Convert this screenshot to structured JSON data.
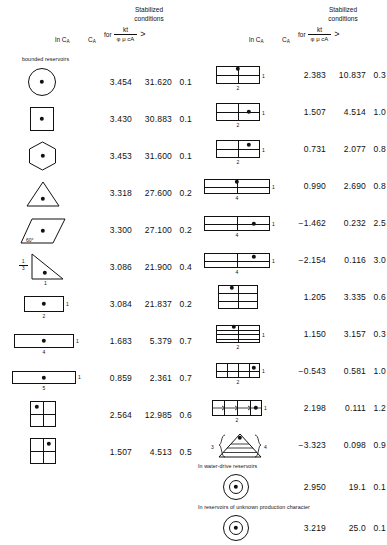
{
  "header": {
    "stabilized_line1": "Stabilized",
    "stabilized_line2": "conditions",
    "for_label": "for",
    "fraction_numerator": "kt",
    "fraction_denominator": "φ μ cA",
    "greater_than": ">",
    "ln_ca_label": "ln C",
    "ln_ca_sub": "A",
    "ca_label": "C",
    "ca_sub": "A"
  },
  "sections": {
    "bounded": "bounded reservoirs",
    "water_drive": "In water-drive reservoirs",
    "unknown": "In reservoirs of unknown production character"
  },
  "left_rows": [
    {
      "shape": "circle-centered",
      "ln_ca": "3.454",
      "ca": "31.620",
      "t_daa": "0.1",
      "labels": {}
    },
    {
      "shape": "square-centered",
      "ln_ca": "3.430",
      "ca": "30.883",
      "t_daa": "0.1",
      "labels": {}
    },
    {
      "shape": "hexagon-centered",
      "ln_ca": "3.453",
      "ca": "31.600",
      "t_daa": "0.1",
      "labels": {}
    },
    {
      "shape": "triangle-centered",
      "ln_ca": "3.318",
      "ca": "27.600",
      "t_daa": "0.2",
      "labels": {}
    },
    {
      "shape": "parallelogram-60",
      "ln_ca": "3.300",
      "ca": "27.100",
      "t_daa": "0.2",
      "labels": {
        "angle": "60°"
      }
    },
    {
      "shape": "right-triangle",
      "ln_ca": "3.086",
      "ca": "21.900",
      "t_daa": "0.4",
      "labels": {
        "left_num": "1",
        "left_den": "3",
        "bottom": "1"
      }
    },
    {
      "shape": "rect-2x1-center",
      "ln_ca": "3.084",
      "ca": "21.837",
      "t_daa": "0.2",
      "labels": {
        "bottom": "2",
        "right": "1"
      }
    },
    {
      "shape": "rect-4x1-center",
      "ln_ca": "1.683",
      "ca": "5.379",
      "t_daa": "0.7",
      "labels": {
        "bottom": "4",
        "right": "1"
      }
    },
    {
      "shape": "rect-5x1-center",
      "ln_ca": "0.859",
      "ca": "2.361",
      "t_daa": "0.7",
      "labels": {
        "bottom": "5",
        "right": "1"
      }
    },
    {
      "shape": "quad-square-top-left",
      "ln_ca": "2.564",
      "ca": "12.985",
      "t_daa": "0.6",
      "labels": {}
    },
    {
      "shape": "quad-square-top-right",
      "ln_ca": "1.507",
      "ca": "4.513",
      "t_daa": "0.5",
      "labels": {}
    }
  ],
  "right_rows": [
    {
      "shape": "rect2-halves-top-center",
      "ln_ca": "2.383",
      "ca": "10.837",
      "t_daa": "0.3",
      "labels": {
        "bottom": "2",
        "right": "1"
      }
    },
    {
      "shape": "rect2-halves-mid-right",
      "ln_ca": "1.507",
      "ca": "4.514",
      "t_daa": "1.0",
      "labels": {
        "bottom": "2",
        "right": "1"
      }
    },
    {
      "shape": "rect2-halves-upper-right",
      "ln_ca": "0.731",
      "ca": "2.077",
      "t_daa": "0.8",
      "labels": {
        "bottom": "2",
        "right": "1"
      }
    },
    {
      "shape": "rect4-halves-top-center",
      "ln_ca": "0.990",
      "ca": "2.690",
      "t_daa": "0.8",
      "labels": {
        "bottom": "4",
        "right": "1"
      }
    },
    {
      "shape": "rect4-halves-mid-right",
      "ln_ca": "−1.462",
      "ca": "0.232",
      "t_daa": "2.5",
      "labels": {
        "bottom": "4",
        "right": "1"
      }
    },
    {
      "shape": "rect4-halves-upper-right",
      "ln_ca": "−2.154",
      "ca": "0.116",
      "t_daa": "3.0",
      "labels": {
        "bottom": "4",
        "right": "1"
      }
    },
    {
      "shape": "grid-1x3-top-left",
      "ln_ca": "1.205",
      "ca": "3.335",
      "t_daa": "0.6",
      "labels": {}
    },
    {
      "shape": "grid-2x4-top-left",
      "ln_ca": "1.150",
      "ca": "3.157",
      "t_daa": "0.3",
      "labels": {
        "bottom": "2",
        "right": "1"
      }
    },
    {
      "shape": "grid-2x2-right",
      "ln_ca": "−0.543",
      "ca": "0.581",
      "t_daa": "1.0",
      "labels": {
        "bottom": "2",
        "right": "1"
      }
    },
    {
      "shape": "grid-arrows-right",
      "ln_ca": "2.198",
      "ca": "0.111",
      "t_daa": "1.2",
      "labels": {
        "bottom": "2",
        "right": "1"
      }
    },
    {
      "shape": "braced-triangle",
      "ln_ca": "−3.323",
      "ca": "0.098",
      "t_daa": "0.9",
      "labels": {
        "left": "3",
        "right": "4"
      }
    }
  ],
  "water_drive_rows": [
    {
      "shape": "circle-ring",
      "ln_ca": "2.950",
      "ca": "19.1",
      "t_daa": "0.1",
      "labels": {}
    }
  ],
  "unknown_rows": [
    {
      "shape": "circle-ring",
      "ln_ca": "3.219",
      "ca": "25.0",
      "t_daa": "0.1",
      "labels": {}
    }
  ]
}
